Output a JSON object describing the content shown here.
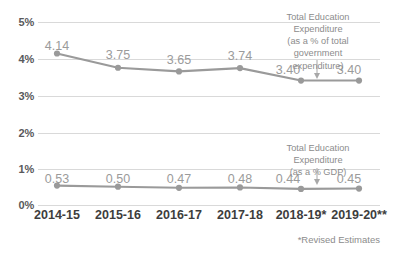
{
  "chart_data": {
    "type": "line",
    "title": "",
    "xlabel": "",
    "ylabel": "",
    "ylim": [
      0,
      5
    ],
    "grid": true,
    "legend_position": "inline-annotation",
    "categories": [
      "2014-15",
      "2015-16",
      "2016-17",
      "2017-18",
      "2018-19*",
      "2019-20**"
    ],
    "ytick_labels": [
      "0%",
      "1%",
      "2%",
      "3%",
      "4%",
      "5%"
    ],
    "ytick_values": [
      0,
      1,
      2,
      3,
      4,
      5
    ],
    "series": [
      {
        "name": "Total Education Expenditure (as a % of total government expenditure)",
        "values": [
          4.14,
          3.75,
          3.65,
          3.74,
          3.4,
          3.4
        ],
        "labels": [
          "4.14",
          "3.75",
          "3.65",
          "3.74",
          "3.40",
          "3.40"
        ],
        "color": "#9a9a9a"
      },
      {
        "name": "Total Education Expenditure (as a % GDP)",
        "values": [
          0.53,
          0.5,
          0.47,
          0.48,
          0.44,
          0.45
        ],
        "labels": [
          "0.53",
          "0.50",
          "0.47",
          "0.48",
          "0.44",
          "0.45"
        ],
        "color": "#9a9a9a"
      }
    ],
    "annotations": [
      {
        "id": "annotation-upper",
        "lines": [
          "Total Education",
          "Expenditure",
          "(as a % of total",
          "government",
          "expenditure)"
        ]
      },
      {
        "id": "annotation-lower",
        "lines": [
          "Total Education",
          "Expenditure",
          "(as a % GDP)"
        ]
      }
    ],
    "footnote": "*Revised Estimates",
    "colors": {
      "line": "#9a9a9a",
      "marker": "#9a9a9a",
      "gridline": "#d9d9d9",
      "axis_text": "#58595b",
      "category_text": "#3d3d3d",
      "data_label_text": "#9b9b9b",
      "annotation_text": "#8c8c8c"
    }
  }
}
